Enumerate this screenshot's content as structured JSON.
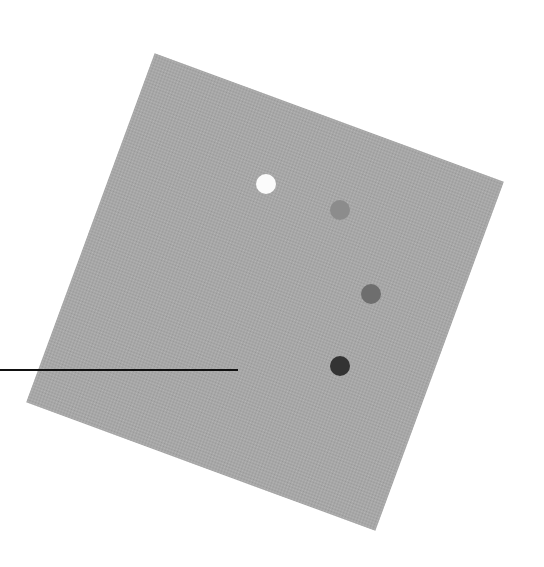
{
  "figure": {
    "background_color": "#ffffff",
    "square": {
      "color": "#a7a7a7",
      "side_px": 372,
      "rotation_deg": 20.2,
      "center": [
        265,
        292
      ]
    },
    "dots": [
      {
        "id": "dot-1",
        "x": 266,
        "y": 184,
        "radius": 10,
        "color": "#fbfbfb"
      },
      {
        "id": "dot-2",
        "x": 340,
        "y": 210,
        "radius": 10,
        "color": "#8c8c8c"
      },
      {
        "id": "dot-3",
        "x": 371,
        "y": 294,
        "radius": 10,
        "color": "#6e6e6e"
      },
      {
        "id": "dot-4",
        "x": 340,
        "y": 366,
        "radius": 10,
        "color": "#333333"
      }
    ],
    "pointer_line": {
      "x1": 0,
      "x2": 238,
      "y": 370,
      "thickness": 2,
      "color": "#111111"
    }
  }
}
